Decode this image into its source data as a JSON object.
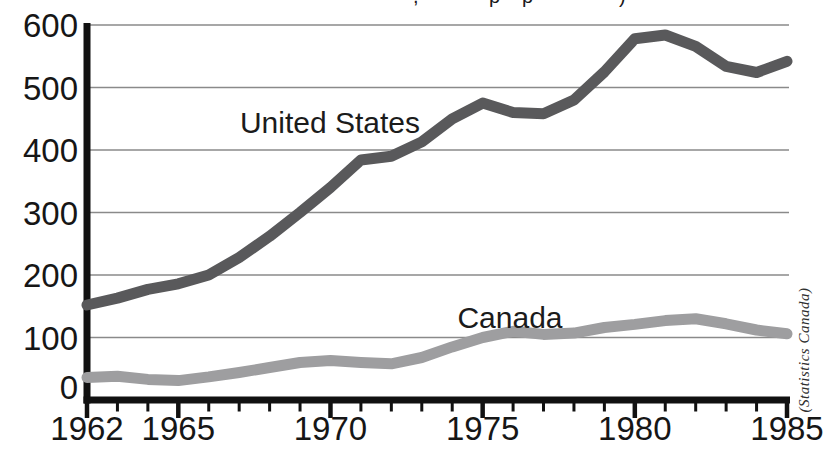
{
  "colors": {
    "us_line": "#59595b",
    "canada_line": "#9e9ea0",
    "grid": "#8a8a8a",
    "axis": "#111111",
    "text": "#161616"
  },
  "chart_data": {
    "type": "line",
    "x_years": [
      1962,
      1963,
      1964,
      1965,
      1966,
      1967,
      1968,
      1969,
      1970,
      1971,
      1972,
      1973,
      1974,
      1975,
      1976,
      1977,
      1978,
      1979,
      1980,
      1981,
      1982,
      1983,
      1984,
      1985
    ],
    "series": [
      {
        "name": "United States",
        "color": "#59595b",
        "values": [
          152,
          163,
          177,
          186,
          200,
          228,
          262,
          300,
          340,
          384,
          390,
          413,
          450,
          475,
          460,
          458,
          480,
          525,
          578,
          584,
          566,
          534,
          524,
          542
        ]
      },
      {
        "name": "Canada",
        "color": "#9e9ea0",
        "values": [
          36,
          38,
          33,
          31,
          37,
          44,
          52,
          60,
          63,
          60,
          58,
          68,
          85,
          100,
          110,
          105,
          107,
          116,
          121,
          127,
          130,
          122,
          112,
          106
        ]
      }
    ],
    "ylim": [
      0,
      600
    ],
    "yticks": [
      0,
      100,
      200,
      300,
      400,
      500,
      600
    ],
    "xtick_labels": [
      "1962",
      "1965",
      "1970",
      "1975",
      "1980",
      "1985"
    ],
    "x_minor_ticks": "every year 1962-1985",
    "grid": "horizontal-only",
    "legend": "inline-labels-on-chart",
    "source_note": "(Statistics Canada)",
    "cropped_title_fragments": [
      {
        "x": 413,
        "glyph": ","
      },
      {
        "x": 489,
        "glyph": "p"
      },
      {
        "x": 522,
        "glyph": "p"
      },
      {
        "x": 619,
        "glyph": ")"
      }
    ]
  }
}
